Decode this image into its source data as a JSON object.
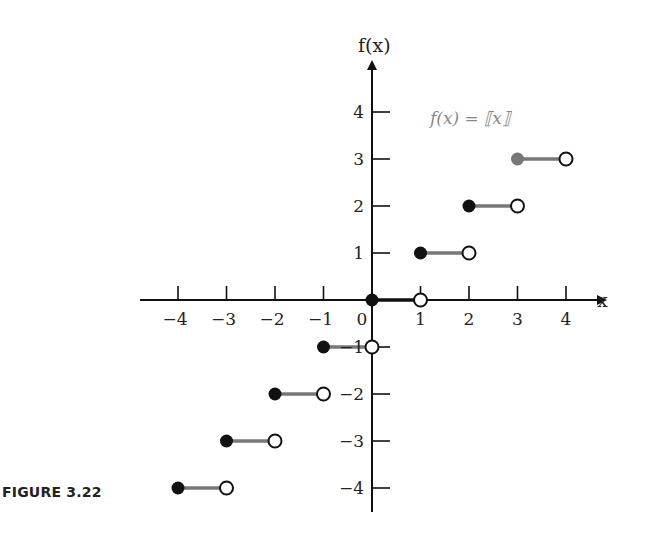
{
  "figure": {
    "caption": "FIGURE 3.22"
  },
  "chart_data": {
    "type": "line",
    "function_label": "f(x) = ⟦x⟧",
    "xlabel": "x",
    "ylabel": "f(x)",
    "xlim": [
      -4.6,
      4.9
    ],
    "ylim": [
      -4.6,
      5.0
    ],
    "x_ticks": [
      -4,
      -3,
      -2,
      -1,
      0,
      1,
      2,
      3,
      4
    ],
    "x_tick_labels": [
      "−4",
      "−3",
      "−2",
      "−1",
      "0",
      "1",
      "2",
      "3",
      "4"
    ],
    "y_ticks": [
      4,
      3,
      2,
      1,
      -1,
      -2,
      -3,
      -4
    ],
    "y_tick_labels": [
      "4",
      "3",
      "2",
      "1",
      "−1",
      "−2",
      "−3",
      "−4"
    ],
    "grid": false,
    "series": [
      {
        "name": "greatest integer function",
        "segments": [
          {
            "x_start": -4,
            "x_end": -3,
            "y": -4,
            "start": "closed",
            "end": "open"
          },
          {
            "x_start": -3,
            "x_end": -2,
            "y": -3,
            "start": "closed",
            "end": "open"
          },
          {
            "x_start": -2,
            "x_end": -1,
            "y": -2,
            "start": "closed",
            "end": "open"
          },
          {
            "x_start": -1,
            "x_end": 0,
            "y": -1,
            "start": "closed",
            "end": "open"
          },
          {
            "x_start": 0,
            "x_end": 1,
            "y": 0,
            "start": "closed",
            "end": "open"
          },
          {
            "x_start": 1,
            "x_end": 2,
            "y": 1,
            "start": "closed",
            "end": "open"
          },
          {
            "x_start": 2,
            "x_end": 3,
            "y": 2,
            "start": "closed",
            "end": "open"
          },
          {
            "x_start": 3,
            "x_end": 4,
            "y": 3,
            "start": "closed",
            "end": "open"
          }
        ]
      }
    ]
  },
  "colors": {
    "axis": "#111111",
    "segment": "#777777",
    "closed_dot": "#111111",
    "highlight_dot": "#777777",
    "formula": "#888888"
  }
}
